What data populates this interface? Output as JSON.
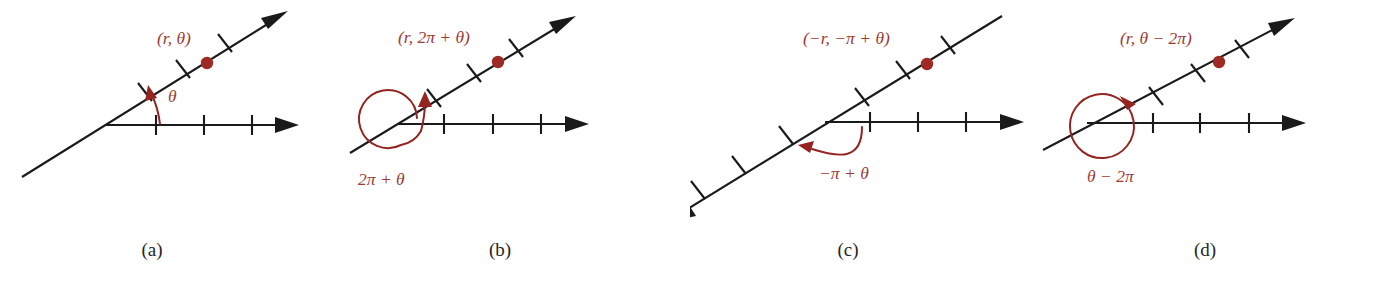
{
  "figure": {
    "kind": "polar-coordinate-representations",
    "background_color": "#ffffff",
    "label_color": "#9e3a33",
    "axis_color": "#1a1a1a",
    "dot_color": "#9e2a24",
    "panel_count": 4
  },
  "panels": [
    {
      "id": "a",
      "caption": "(a)",
      "point_label": "(r, θ)",
      "angle_label": "θ",
      "angle_sweep": "counterclockwise-small",
      "ray_ticks": 3,
      "axis_ticks": 3,
      "has_full_loop": false,
      "ray_direction": "up-right",
      "dot_on": "upper-right-ray"
    },
    {
      "id": "b",
      "caption": "(b)",
      "point_label": "(r, 2π + θ)",
      "angle_label": "2π + θ",
      "angle_sweep": "counterclockwise-full-turn-plus",
      "ray_ticks": 3,
      "axis_ticks": 3,
      "has_full_loop": true,
      "ray_direction": "up-right",
      "dot_on": "upper-right-ray"
    },
    {
      "id": "c",
      "caption": "(c)",
      "point_label": "(−r, −π + θ)",
      "angle_label": "−π + θ",
      "angle_sweep": "clockwise-half-turn",
      "ray_ticks": 3,
      "axis_ticks": 3,
      "has_full_loop": false,
      "ray_direction": "both-ways",
      "dot_on": "upper-right-ray"
    },
    {
      "id": "d",
      "caption": "(d)",
      "point_label": "(r, θ − 2π)",
      "angle_label": "θ − 2π",
      "angle_sweep": "clockwise-full-turn",
      "ray_ticks": 3,
      "axis_ticks": 3,
      "has_full_loop": true,
      "ray_direction": "up-right",
      "dot_on": "upper-right-ray"
    }
  ]
}
